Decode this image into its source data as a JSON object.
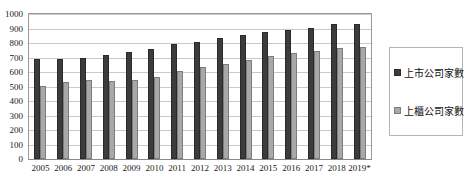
{
  "chart_data": {
    "type": "bar",
    "title": "",
    "subtitle": "",
    "xlabel": "",
    "ylabel": "",
    "ylim": [
      0,
      1000
    ],
    "ytick_step": 100,
    "yticks": [
      "1000",
      "900",
      "800",
      "700",
      "600",
      "500",
      "400",
      "300",
      "200",
      "100",
      "0"
    ],
    "grid": true,
    "legend_position": "right",
    "categories": [
      "2005",
      "2006",
      "2007",
      "2008",
      "2009",
      "2010",
      "2011",
      "2012",
      "2013",
      "2014",
      "2015",
      "2016",
      "2017",
      "2018",
      "2019*"
    ],
    "series": [
      {
        "name": "上市公司家數",
        "color": "#3c3c3c",
        "values": [
          691,
          688,
          698,
          718,
          741,
          758,
          790,
          809,
          838,
          854,
          874,
          892,
          907,
          928,
          931
        ]
      },
      {
        "name": "上櫃公司家數",
        "color": "#a8a8a8",
        "values": [
          503,
          531,
          547,
          539,
          546,
          564,
          607,
          638,
          658,
          685,
          712,
          732,
          744,
          766,
          770
        ]
      }
    ]
  },
  "legend": {
    "items": [
      {
        "label": "上市公司家數"
      },
      {
        "label": "上櫃公司家數"
      }
    ]
  },
  "colors": {
    "series_dark": "#3c3c3c",
    "series_light": "#a8a8a8",
    "gridline": "#c9c9c9",
    "frame": "#9a9a9a",
    "text": "#1a1a1a",
    "background": "#ffffff"
  }
}
